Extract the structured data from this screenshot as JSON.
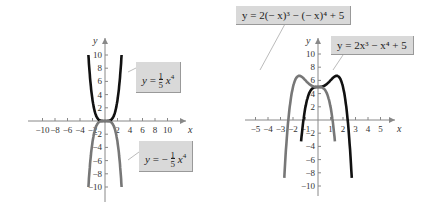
{
  "chart_data": [
    {
      "type": "line",
      "title": "",
      "xlabel": "x",
      "ylabel": "y",
      "xlim": [
        -10,
        10
      ],
      "ylim": [
        -10,
        10
      ],
      "x_ticks": [
        -10,
        -8,
        -6,
        -4,
        -2,
        2,
        4,
        6,
        8,
        10
      ],
      "y_ticks": [
        -10,
        -8,
        -6,
        -4,
        -2,
        2,
        4,
        6,
        8,
        10
      ],
      "series": [
        {
          "name": "y = (1/5)x^4",
          "color": "#111111",
          "x": [
            -2.66,
            -2,
            -1,
            0,
            1,
            2,
            2.66
          ],
          "values": [
            10,
            3.2,
            0.2,
            0,
            0.2,
            3.2,
            10
          ]
        },
        {
          "name": "y = -(1/5)x^4",
          "color": "#777777",
          "x": [
            -2.66,
            -2,
            -1,
            0,
            1,
            2,
            2.66
          ],
          "values": [
            -10,
            -3.2,
            -0.2,
            0,
            -0.2,
            -3.2,
            -10
          ]
        }
      ],
      "annotations": [
        "y = 1/5 x^4",
        "y = -1/5 x^4"
      ]
    },
    {
      "type": "line",
      "title": "",
      "xlabel": "x",
      "ylabel": "y",
      "xlim": [
        -5,
        5
      ],
      "ylim": [
        -10,
        10
      ],
      "x_ticks": [
        -5,
        -4,
        -3,
        -2,
        -1,
        1,
        2,
        3,
        4,
        5
      ],
      "y_ticks": [
        -10,
        -8,
        -6,
        -4,
        -2,
        2,
        4,
        6,
        8,
        10
      ],
      "series": [
        {
          "name": "y = 2x^3 - x^4 + 5",
          "color": "#111111",
          "x": [
            -1.35,
            -1,
            0,
            1,
            1.5,
            2,
            2.7
          ],
          "values": [
            -10,
            2,
            5,
            6,
            6.69,
            5,
            -10
          ]
        },
        {
          "name": "y = 2(-x)^3 - (-x)^4 + 5",
          "color": "#777777",
          "x": [
            -2.7,
            -2,
            -1.5,
            -1,
            0,
            1,
            1.35
          ],
          "values": [
            -10,
            5,
            6.69,
            6,
            5,
            2,
            -10
          ]
        }
      ],
      "annotations": [
        "y = 2(- x)^3 - (- x)^4 + 5",
        "y = 2x^3 - x^4 + 5"
      ]
    }
  ],
  "labels": {
    "left_top": {
      "pre": "y = ",
      "num": "1",
      "den": "5",
      "post": "x",
      "exp": "4"
    },
    "left_bottom": {
      "pre": "y = −",
      "num": "1",
      "den": "5",
      "post": "x",
      "exp": "4"
    },
    "right_top": "y = 2(− x)³ − (− x)⁴ + 5",
    "right_mid": "y = 2x³ − x⁴ + 5"
  },
  "axis": {
    "x": "x",
    "y": "y"
  }
}
